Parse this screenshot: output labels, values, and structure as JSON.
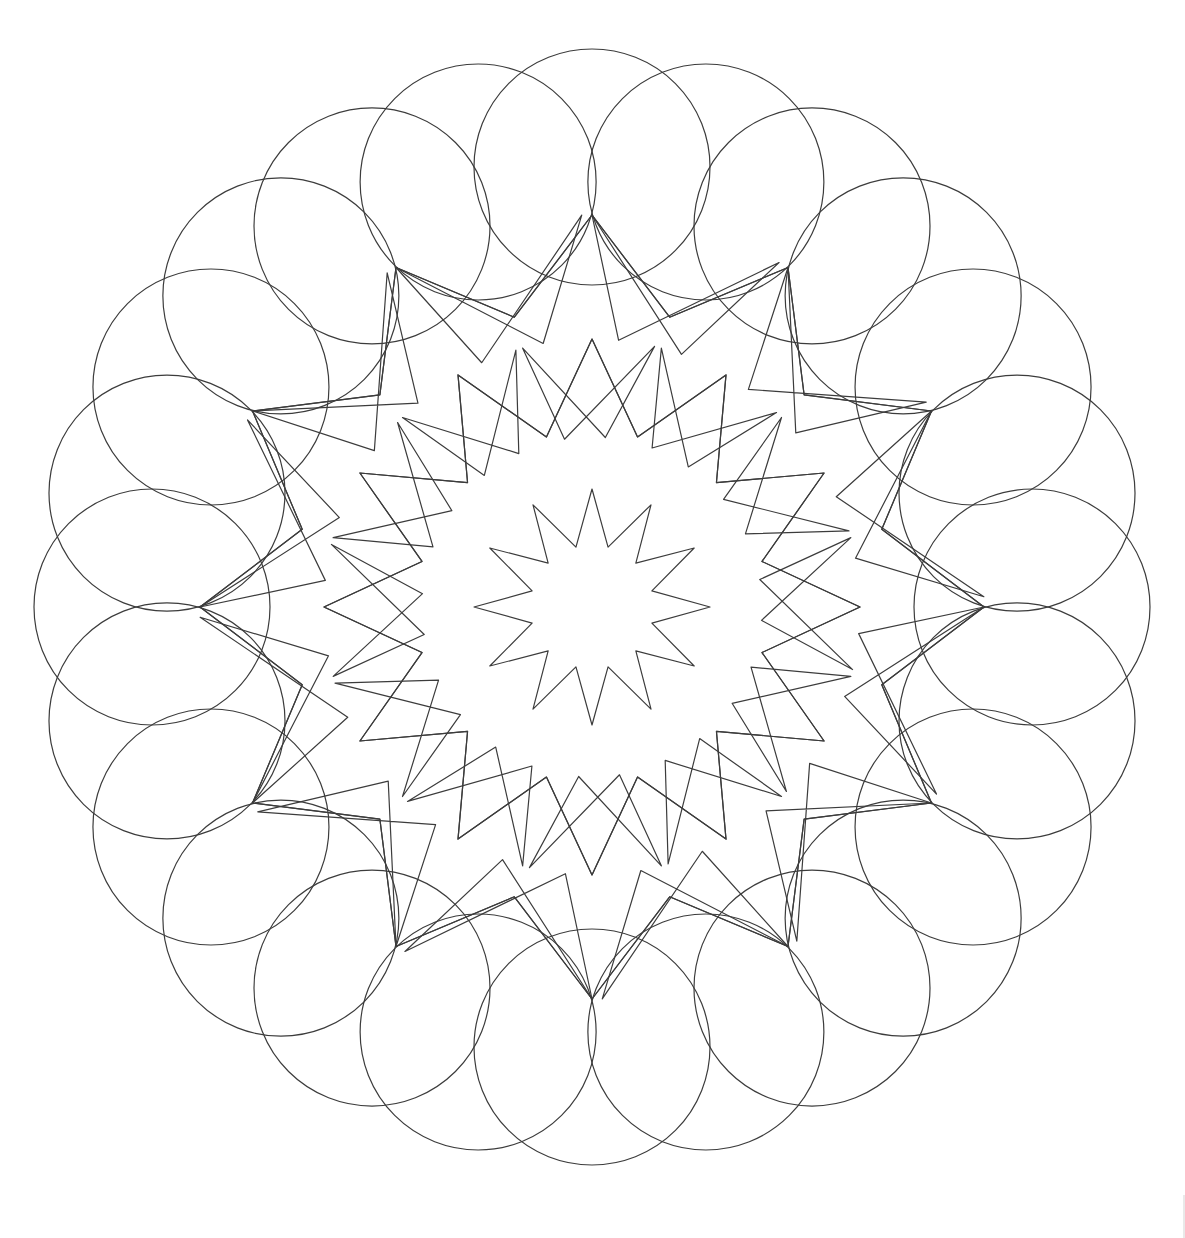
{
  "page": {
    "background_color": "#ffffff",
    "width": 1185,
    "height": 1238
  },
  "artwork": {
    "name": "twelve-fold-star-mandala",
    "description": "Line-art mandala with twelve-fold rotational symmetry: a hollow twelve-pointed central star, two concentric rings of kite and pentagon tiles, and a scalloped petal border formed by twenty-four overlapping circles.",
    "style": {
      "stroke_color": "#3c3c3c",
      "stroke_width": 1.2,
      "fill": "none",
      "line_cap": "round"
    },
    "geometry": {
      "center_x": 592,
      "center_y": 607,
      "symmetry_order": 12,
      "outer_radius": 556,
      "scallop_circle_count": 24,
      "scallop_circle_radius": 118,
      "scallop_ring_radius": 440,
      "ring_radii": {
        "inner_star_outer": 118,
        "inner_star_inner": 62,
        "mid_ring_outer": 268,
        "mid_ring_inner": 176,
        "outer_ring_outer": 392,
        "outer_ring_inner": 300
      }
    },
    "layers": [
      {
        "id": "scallop-border",
        "label": "Scalloped petal border"
      },
      {
        "id": "outer-star-ring",
        "label": "Outer star polygon ring"
      },
      {
        "id": "mid-star-ring",
        "label": "Middle star polygon ring"
      },
      {
        "id": "kite-ring-outer",
        "label": "Outer kite tile ring"
      },
      {
        "id": "kite-ring-inner",
        "label": "Inner kite tile ring"
      },
      {
        "id": "central-star",
        "label": "Central twelve-pointed star"
      }
    ]
  },
  "edge_marker": {
    "label": "page-edge-rule"
  }
}
